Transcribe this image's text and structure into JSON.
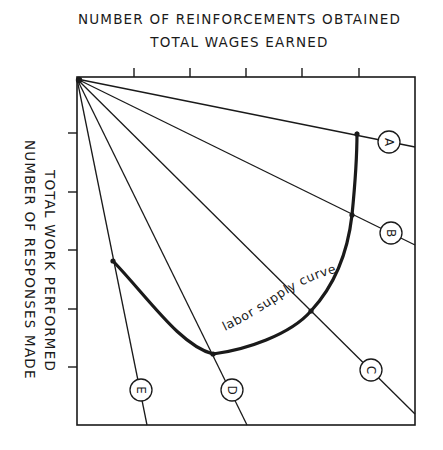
{
  "chart": {
    "title_lines": [
      "NUMBER OF REINFORCEMENTS OBTAINED",
      "TOTAL WAGES EARNED"
    ],
    "y_axis_lines": [
      "TOTAL WORK PERFORMED",
      "NUMBER OF RESPONSES MADE"
    ],
    "curve_label": "labor supply curve",
    "rays": [
      {
        "id": "A",
        "label": "A"
      },
      {
        "id": "B",
        "label": "B"
      },
      {
        "id": "C",
        "label": "C"
      },
      {
        "id": "D",
        "label": "D"
      },
      {
        "id": "E",
        "label": "E"
      }
    ],
    "colors": {
      "ink": "#1a1a1a",
      "background": "#ffffff"
    }
  }
}
